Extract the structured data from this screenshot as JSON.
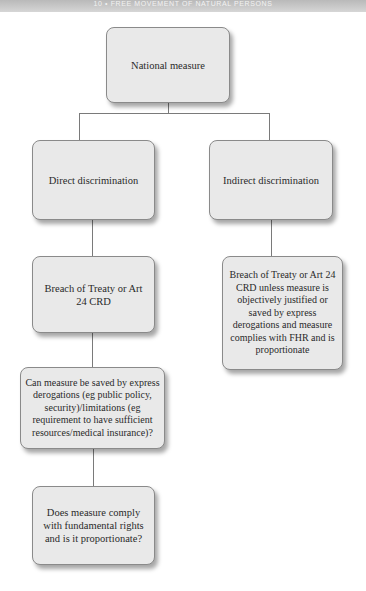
{
  "header": {
    "running_title": "10 • FREE MOVEMENT OF NATURAL PERSONS"
  },
  "diagram": {
    "type": "flowchart",
    "nodes": {
      "root": {
        "label": "National measure"
      },
      "direct": {
        "label": "Direct discrimination"
      },
      "indirect": {
        "label": "Indirect discrimination"
      },
      "direct_breach": {
        "label": "Breach of Treaty or Art 24 CRD"
      },
      "indirect_breach": {
        "label": "Breach of Treaty or Art 24 CRD unless measure is objectively justified or saved by express derogations and measure complies with FHR and is proportionate"
      },
      "derogations_question": {
        "label": "Can measure be saved by express derogations (eg public policy, security)/limitations (eg requirement to have sufficient resources/medical insurance)?"
      },
      "fundamental_rights_question": {
        "label": "Does measure comply with fundamental rights and is it proportionate?"
      }
    },
    "edges": [
      [
        "root",
        "direct"
      ],
      [
        "root",
        "indirect"
      ],
      [
        "direct",
        "direct_breach"
      ],
      [
        "indirect",
        "indirect_breach"
      ],
      [
        "direct_breach",
        "derogations_question"
      ],
      [
        "derogations_question",
        "fundamental_rights_question"
      ]
    ],
    "colors": {
      "box_fill": "#e9e9e9",
      "box_border": "#8a8a8a",
      "connector": "#7a7a7a"
    }
  }
}
